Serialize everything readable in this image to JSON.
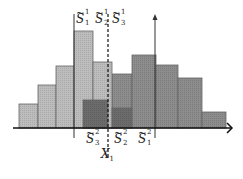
{
  "diagram": {
    "type": "overlapping histograms",
    "colors": {
      "light_bar": "#b8b8b8",
      "dark_bar": "#8a8a8a",
      "overlap_bar": "#6a6a6a",
      "bar_border": "#555555",
      "axis": "#111111"
    },
    "histogram_1_bars": [
      {
        "x": 19,
        "width": 19,
        "top": 104
      },
      {
        "x": 38,
        "width": 18,
        "top": 85
      },
      {
        "x": 56,
        "width": 18,
        "top": 66
      },
      {
        "x": 74,
        "width": 19,
        "top": 31
      },
      {
        "x": 93,
        "width": 19,
        "top": 62
      }
    ],
    "histogram_2_bars": [
      {
        "x": 83,
        "width": 29,
        "top": 100
      },
      {
        "x": 112,
        "width": 20,
        "top": 74
      },
      {
        "x": 132,
        "width": 24,
        "top": 55
      },
      {
        "x": 156,
        "width": 22,
        "top": 65
      },
      {
        "x": 178,
        "width": 24,
        "top": 78
      },
      {
        "x": 202,
        "width": 24,
        "top": 112
      }
    ],
    "overlap_region": {
      "x": 112,
      "width": 20,
      "top": 108
    },
    "axis_y": 128,
    "labels_top": [
      {
        "base": "S",
        "sup": "1",
        "sub": "1",
        "x": 76
      },
      {
        "base": "S",
        "sup": "1",
        "sub": "2",
        "x": 95
      },
      {
        "base": "S",
        "sup": "1",
        "sub": "3",
        "x": 112
      }
    ],
    "labels_bottom": [
      {
        "base": "S",
        "sup": "2",
        "sub": "3",
        "x": 86
      },
      {
        "base": "S",
        "sup": "2",
        "sub": "2",
        "x": 114
      },
      {
        "base": "S",
        "sup": "2",
        "sub": "1",
        "x": 138
      }
    ],
    "dashed_line_label": {
      "base": "X",
      "sub": "1"
    }
  }
}
